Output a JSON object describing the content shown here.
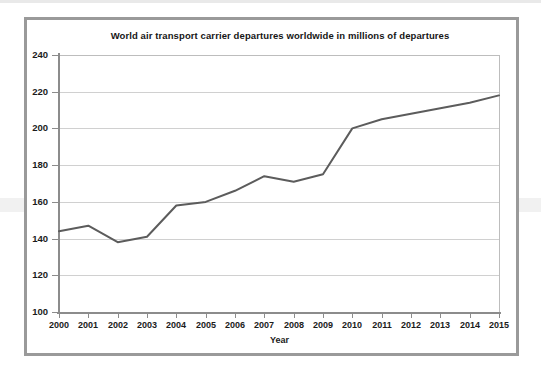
{
  "chart_data": {
    "type": "line",
    "title": "World air transport carrier departures worldwide in millions of departures",
    "xlabel": "Year",
    "ylabel": "",
    "categories": [
      "2000",
      "2001",
      "2002",
      "2003",
      "2004",
      "2005",
      "2006",
      "2007",
      "2008",
      "2009",
      "2010",
      "2011",
      "2012",
      "2013",
      "2014",
      "2015"
    ],
    "values": [
      144,
      147,
      138,
      141,
      158,
      160,
      166,
      174,
      171,
      175,
      200,
      205,
      208,
      211,
      214,
      218
    ],
    "series": [
      {
        "name": "World air transport carrier departures",
        "values": [
          144,
          147,
          138,
          141,
          158,
          160,
          166,
          174,
          171,
          175,
          200,
          205,
          208,
          211,
          214,
          218
        ]
      }
    ],
    "ylim": [
      100,
      240
    ],
    "yticks": [
      100,
      120,
      140,
      160,
      180,
      200,
      220,
      240
    ],
    "ytick_labels": [
      "100",
      "120",
      "140",
      "160",
      "180",
      "200",
      "220",
      "240"
    ],
    "xlim": [
      "2000",
      "2015"
    ],
    "grid": "horizontal",
    "legend": "none",
    "units": "millions of departures"
  },
  "style": {
    "line_color": "#5c5c5c",
    "grid_color": "#d0d0d0",
    "axis_color": "#8c8c8c",
    "text_color": "#1b1b1b",
    "frame_color": "#9a9a9a",
    "background": "#ffffff"
  }
}
